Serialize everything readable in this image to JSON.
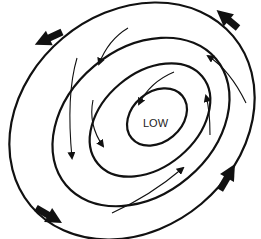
{
  "diagram": {
    "center_label": "LOW",
    "colors": {
      "background": "#ffffff",
      "isobar": "#111111",
      "wind_arrow": "#111111",
      "label": "#222222"
    },
    "isobars": [
      {
        "id": "isobar-1",
        "cx": 157,
        "cy": 117,
        "rx": 33,
        "ry": 26,
        "rotate": -40
      },
      {
        "id": "isobar-2",
        "cx": 149,
        "cy": 121,
        "rx": 68,
        "ry": 48,
        "rotate": -40
      },
      {
        "id": "isobar-3",
        "cx": 140,
        "cy": 122,
        "rx": 97,
        "ry": 74,
        "rotate": -40
      },
      {
        "id": "isobar-4",
        "cx": 132,
        "cy": 121,
        "rx": 130,
        "ry": 110,
        "rotate": -40
      }
    ],
    "wind_arrows": [
      {
        "id": "arrow-outer-top-left",
        "type": "thick",
        "direction": "counterclockwise-inward"
      },
      {
        "id": "arrow-outer-top-right",
        "type": "thick",
        "direction": "counterclockwise-inward"
      },
      {
        "id": "arrow-outer-bottom-left",
        "type": "thick",
        "direction": "counterclockwise-inward"
      },
      {
        "id": "arrow-outer-bottom-right",
        "type": "thick",
        "direction": "counterclockwise-inward"
      },
      {
        "id": "arrow-inner-1",
        "type": "thin",
        "direction": "inward"
      },
      {
        "id": "arrow-inner-2",
        "type": "thin",
        "direction": "inward"
      },
      {
        "id": "arrow-inner-3",
        "type": "thin",
        "direction": "inward"
      },
      {
        "id": "arrow-inner-4",
        "type": "thin",
        "direction": "inward"
      },
      {
        "id": "arrow-inner-5",
        "type": "thin",
        "direction": "inward"
      },
      {
        "id": "arrow-inner-6",
        "type": "thin",
        "direction": "inward"
      },
      {
        "id": "arrow-inner-7",
        "type": "thin",
        "direction": "inward"
      }
    ]
  }
}
